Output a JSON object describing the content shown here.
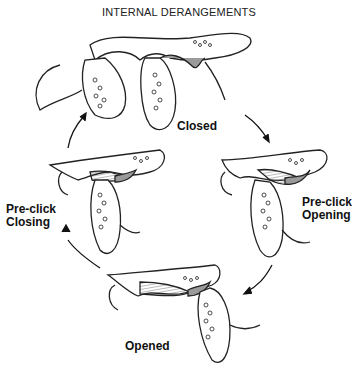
{
  "title": "INTERNAL DERANGEMENTS",
  "stages": [
    {
      "name": "closed",
      "label": "Closed"
    },
    {
      "name": "pre-click-opening",
      "label_line1": "Pre-click",
      "label_line2": "Opening"
    },
    {
      "name": "opened",
      "label": "Opened"
    },
    {
      "name": "pre-click-closing",
      "label_line1": "Pre-click",
      "label_line2": "Closing"
    }
  ],
  "colors": {
    "line": "#222222",
    "disc": "#9a9a9a",
    "hatch": "#777777",
    "background": "#ffffff"
  }
}
